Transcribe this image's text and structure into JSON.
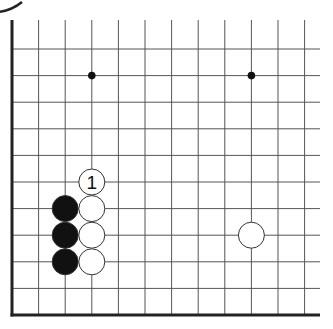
{
  "diagram": {
    "type": "go-board-fragment",
    "corner": "bottom-left",
    "grid": {
      "columns_visible": 12,
      "rows_visible": 11,
      "origin_x": 12,
      "origin_y": 315,
      "spacing": 26.6,
      "line_color": "#555555",
      "border_color": "#222222"
    },
    "star_points": [
      {
        "col": 3,
        "row": 9
      },
      {
        "col": 9,
        "row": 9
      }
    ],
    "stones": [
      {
        "color": "black",
        "col": 2,
        "row": 4
      },
      {
        "color": "black",
        "col": 2,
        "row": 3
      },
      {
        "color": "black",
        "col": 2,
        "row": 2
      },
      {
        "color": "white",
        "col": 3,
        "row": 5,
        "label": "1"
      },
      {
        "color": "white",
        "col": 3,
        "row": 4
      },
      {
        "color": "white",
        "col": 3,
        "row": 3
      },
      {
        "color": "white",
        "col": 3,
        "row": 2
      },
      {
        "color": "white",
        "col": 9,
        "row": 3
      }
    ],
    "colors": {
      "black_stone": "#111111",
      "white_stone": "#ffffff",
      "stone_outline": "#333333"
    }
  }
}
